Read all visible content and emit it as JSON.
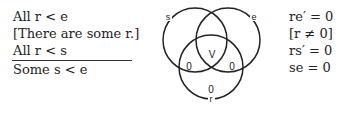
{
  "premises": [
    "All r < e",
    "[There are some r.]",
    "All r < s"
  ],
  "conclusion": "Some s < e",
  "diagram": {
    "circles": [
      {
        "label": "s",
        "cx": 195,
        "cy": 40,
        "r": 32
      },
      {
        "label": "e",
        "cx": 228,
        "cy": 40,
        "r": 32
      },
      {
        "label": "r",
        "cx": 211,
        "cy": 67,
        "r": 32
      }
    ],
    "marks": [
      {
        "text": "V",
        "x": 211,
        "y": 55
      },
      {
        "text": "0",
        "x": 189,
        "y": 67
      },
      {
        "text": "0",
        "x": 232,
        "y": 67
      },
      {
        "text": "0",
        "x": 211,
        "y": 90
      }
    ]
  },
  "equations": [
    "re′ = 0",
    "[r ≠ 0]",
    "rs′ = 0",
    "se = 0"
  ]
}
